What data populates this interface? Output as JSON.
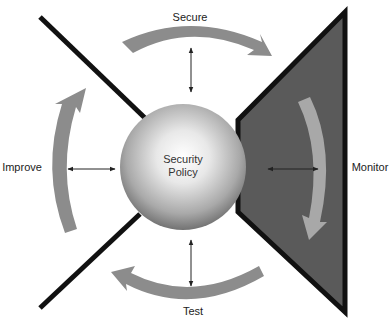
{
  "diagram": {
    "center": {
      "title_line1": "Security",
      "title_line2": "Policy"
    },
    "stages": [
      {
        "id": "secure",
        "label": "Secure",
        "position": "top"
      },
      {
        "id": "monitor",
        "label": "Monitor",
        "position": "right"
      },
      {
        "id": "test",
        "label": "Test",
        "position": "bottom"
      },
      {
        "id": "improve",
        "label": "Improve",
        "position": "left"
      }
    ],
    "colors": {
      "arrow_fill": "#8c8c8c",
      "arrow_fill_light": "#a8a8a8",
      "triangle_fill": "#595959",
      "line_color": "#111111",
      "sphere_light": "#ffffff",
      "sphere_dark": "#6e6e6e"
    }
  }
}
